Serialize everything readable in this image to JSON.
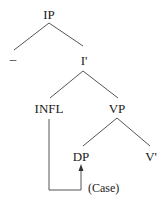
{
  "diagram": {
    "type": "syntax-tree",
    "nodes": {
      "ip": "IP",
      "spec": "–",
      "i_bar": "I'",
      "infl": "INFL",
      "vp": "VP",
      "dp": "DP",
      "v_bar": "V'"
    },
    "annotation": {
      "case_label": "(Case)"
    },
    "edges": [
      [
        "IP",
        "–"
      ],
      [
        "IP",
        "I'"
      ],
      [
        "I'",
        "INFL"
      ],
      [
        "I'",
        "VP"
      ],
      [
        "VP",
        "DP"
      ],
      [
        "VP",
        "V'"
      ]
    ],
    "arrows": [
      {
        "from": "INFL",
        "to": "DP",
        "label": "(Case)"
      }
    ],
    "colors": {
      "line": "#555555",
      "text": "#1a1a1a",
      "background": "#ffffff"
    }
  }
}
